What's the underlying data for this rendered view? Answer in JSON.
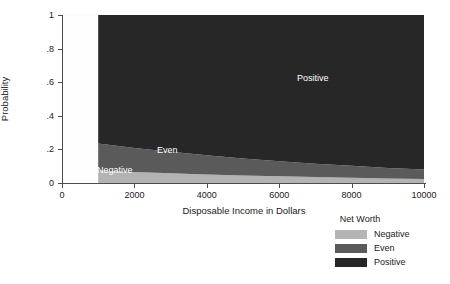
{
  "chart_data": {
    "type": "area",
    "title": "",
    "xlabel": "Disposable Income in Dollars",
    "ylabel": "Probability",
    "xlim": [
      0,
      10000
    ],
    "ylim": [
      0,
      1
    ],
    "xticks": [
      0,
      2000,
      4000,
      6000,
      8000,
      10000
    ],
    "xtick_labels": [
      "0",
      "2000",
      "4000",
      "6000",
      "8000",
      "10000"
    ],
    "yticks": [
      0,
      0.2,
      0.4,
      0.6,
      0.8,
      1
    ],
    "ytick_labels": [
      "0",
      ".2",
      ".4",
      ".6",
      ".8",
      "1"
    ],
    "grid": false,
    "legend_position": "bottom-right",
    "legend_title": "Net Worth",
    "data_x_range": [
      1000,
      10000
    ],
    "stacked": true,
    "x": [
      1000,
      2000,
      3000,
      4000,
      5000,
      6000,
      7000,
      8000,
      9000,
      10000
    ],
    "series": [
      {
        "name": "Negative",
        "color": "#b4b4b4",
        "label_in_plot": "Negative",
        "values": [
          0.075,
          0.066,
          0.058,
          0.051,
          0.045,
          0.04,
          0.035,
          0.031,
          0.027,
          0.024
        ]
      },
      {
        "name": "Even",
        "color": "#5a5a5a",
        "label_in_plot": "Even",
        "values": [
          0.16,
          0.143,
          0.128,
          0.114,
          0.101,
          0.09,
          0.08,
          0.071,
          0.063,
          0.056
        ]
      },
      {
        "name": "Positive",
        "color": "#262626",
        "label_in_plot": "Positive",
        "values": [
          0.765,
          0.791,
          0.814,
          0.835,
          0.854,
          0.87,
          0.885,
          0.898,
          0.91,
          0.92
        ]
      }
    ],
    "cumulative_boundaries": {
      "negative_top": [
        0.075,
        0.066,
        0.058,
        0.051,
        0.045,
        0.04,
        0.035,
        0.031,
        0.027,
        0.024
      ],
      "even_top": [
        0.235,
        0.209,
        0.186,
        0.165,
        0.146,
        0.13,
        0.115,
        0.102,
        0.09,
        0.08
      ]
    }
  },
  "axes": {
    "y_title": "Probability",
    "x_title": "Disposable Income in Dollars"
  },
  "plot_labels": {
    "positive": "Positive",
    "even": "Even",
    "negative": "Negative"
  },
  "legend": {
    "title": "Net Worth",
    "items": [
      {
        "label": "Negative",
        "color": "#b4b4b4"
      },
      {
        "label": "Even",
        "color": "#5a5a5a"
      },
      {
        "label": "Positive",
        "color": "#262626"
      }
    ]
  }
}
